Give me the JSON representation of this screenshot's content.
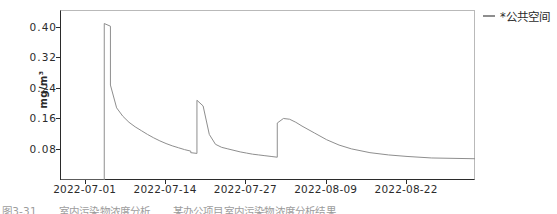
{
  "chart_data": {
    "type": "line",
    "title": "",
    "subtitle": "",
    "xlabel": "",
    "ylabel": "mg/m³",
    "grid": false,
    "legend_position": "right",
    "ylim": [
      0.0,
      0.445
    ],
    "yticks": [
      0.08,
      0.16,
      0.24,
      0.32,
      0.4
    ],
    "ytick_labels": [
      "0.08",
      "0.16",
      "0.24",
      "0.32",
      "0.40"
    ],
    "xlim": [
      "2022-06-27",
      "2022-09-02"
    ],
    "xticks": [
      "2022-07-01",
      "2022-07-14",
      "2022-07-27",
      "2022-08-09",
      "2022-08-22"
    ],
    "series": [
      {
        "name": "*公共空间",
        "color": "#8e8e8e",
        "x": [
          "2022-06-27",
          "2022-07-04",
          "2022-07-04",
          "2022-07-05",
          "2022-07-05",
          "2022-07-06",
          "2022-07-07",
          "2022-07-08",
          "2022-07-09",
          "2022-07-10",
          "2022-07-11",
          "2022-07-12",
          "2022-07-13",
          "2022-07-14",
          "2022-07-15",
          "2022-07-16",
          "2022-07-17",
          "2022-07-18",
          "2022-07-18",
          "2022-07-19",
          "2022-07-19",
          "2022-07-20",
          "2022-07-21",
          "2022-07-22",
          "2022-07-23",
          "2022-07-24",
          "2022-07-25",
          "2022-07-26",
          "2022-07-27",
          "2022-07-28",
          "2022-07-29",
          "2022-07-30",
          "2022-07-31",
          "2022-08-01",
          "2022-08-01",
          "2022-08-02",
          "2022-08-03",
          "2022-08-04",
          "2022-08-05",
          "2022-08-07",
          "2022-08-09",
          "2022-08-11",
          "2022-08-13",
          "2022-08-16",
          "2022-08-19",
          "2022-08-22",
          "2022-08-26",
          "2022-09-02"
        ],
        "y": [
          0.0,
          0.0,
          0.412,
          0.405,
          0.25,
          0.19,
          0.168,
          0.152,
          0.14,
          0.13,
          0.12,
          0.111,
          0.103,
          0.096,
          0.09,
          0.085,
          0.08,
          0.076,
          0.072,
          0.07,
          0.21,
          0.195,
          0.12,
          0.094,
          0.086,
          0.082,
          0.078,
          0.074,
          0.071,
          0.068,
          0.066,
          0.064,
          0.062,
          0.06,
          0.15,
          0.162,
          0.16,
          0.152,
          0.142,
          0.124,
          0.106,
          0.092,
          0.082,
          0.072,
          0.066,
          0.062,
          0.058,
          0.056
        ],
        "peaks": [
          {
            "date": "2022-07-04",
            "value": 0.412
          },
          {
            "date": "2022-07-19",
            "value": 0.21
          },
          {
            "date": "2022-08-02",
            "value": 0.162
          }
        ]
      }
    ]
  },
  "axes": {
    "y_label": "mg/m³",
    "y_ticks": [
      {
        "label": "0.40",
        "value": 0.4
      },
      {
        "label": "0.32",
        "value": 0.32
      },
      {
        "label": "0.24",
        "value": 0.24
      },
      {
        "label": "0.16",
        "value": 0.16
      },
      {
        "label": "0.08",
        "value": 0.08
      }
    ],
    "x_ticks": [
      {
        "label": "2022-07-01"
      },
      {
        "label": "2022-07-14"
      },
      {
        "label": "2022-07-27"
      },
      {
        "label": "2022-08-09"
      },
      {
        "label": "2022-08-22"
      }
    ]
  },
  "legend": {
    "items": [
      {
        "label": "*公共空间",
        "color": "#8e8e8e"
      }
    ]
  },
  "caption": {
    "figure_number": "图3-31",
    "text": "室内污染物浓度分析",
    "subtext": "某办公项目室内污染物浓度分析结果"
  },
  "colors": {
    "line": "#8e8e8e",
    "axis": "#2b2b2b",
    "frame": "#b9b9b9",
    "background": "#ffffff"
  }
}
